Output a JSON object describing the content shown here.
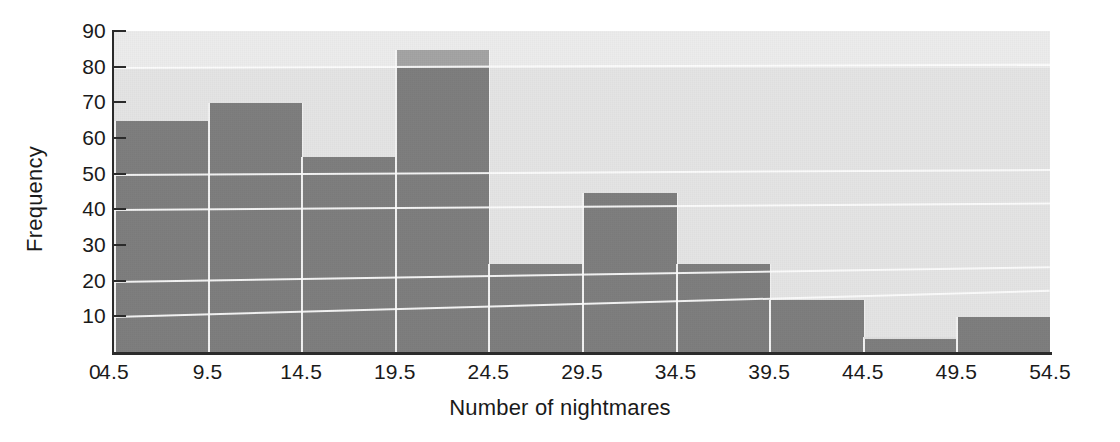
{
  "chart_data": {
    "type": "bar",
    "title": "",
    "xlabel": "Number of nightmares",
    "ylabel": "Frequency",
    "categories": [
      "4.5-9.5",
      "9.5-14.5",
      "14.5-19.5",
      "19.5-24.5",
      "24.5-29.5",
      "29.5-34.5",
      "34.5-39.5",
      "39.5-44.5",
      "44.5-49.5",
      "49.5-54.5"
    ],
    "bin_edges": [
      4.5,
      9.5,
      14.5,
      19.5,
      24.5,
      29.5,
      34.5,
      39.5,
      44.5,
      49.5,
      54.5
    ],
    "values": [
      65,
      70,
      55,
      85,
      25,
      45,
      25,
      15,
      4,
      10
    ],
    "xlim": [
      4.5,
      54.5
    ],
    "ylim": [
      0,
      90
    ],
    "ytick_values": [
      10,
      20,
      30,
      40,
      50,
      60,
      70,
      80,
      90
    ],
    "ytick_labels": [
      "10",
      "20",
      "30",
      "40",
      "50",
      "60",
      "70",
      "80",
      "90"
    ],
    "xtick_values": [
      4.5,
      9.5,
      14.5,
      19.5,
      24.5,
      29.5,
      34.5,
      39.5,
      44.5,
      49.5,
      54.5
    ],
    "xtick_labels": [
      "4.5",
      "9.5",
      "14.5",
      "19.5",
      "24.5",
      "29.5",
      "34.5",
      "39.5",
      "44.5",
      "49.5",
      "54.5"
    ],
    "origin_label": "0",
    "grid": true,
    "gridline_values": [
      10,
      20,
      40,
      50,
      80
    ],
    "legend": null,
    "bar_color": "#7c7c7c",
    "plot_background": "#e4e4e4",
    "gridline_color": "#fdfdfd",
    "axis_color": "#2b2b2b",
    "text_color": "#1a1a1a"
  }
}
